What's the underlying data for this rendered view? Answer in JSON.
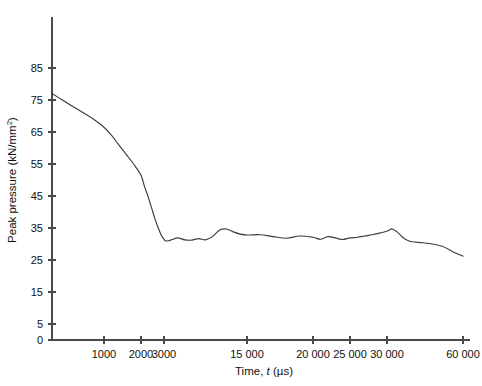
{
  "chart_data": {
    "type": "line",
    "title": "",
    "xlabel": "Time, t (µs)",
    "xlabel_parts": {
      "prefix": "Time, ",
      "italic": "t",
      "suffix": " (µs)"
    },
    "ylabel": "Peak pressure (kN/mm²)",
    "ylabel_parts": {
      "text": "Peak pressure (kN/mm",
      "superscript": "2",
      "close": ")"
    },
    "ylim": [
      0,
      90
    ],
    "y_ticks": [
      0,
      5,
      15,
      25,
      35,
      45,
      55,
      65,
      75,
      85
    ],
    "y_tick_labels": [
      "0",
      "5",
      "15",
      "25",
      "35",
      "45",
      "55",
      "65",
      "75",
      "85"
    ],
    "x_ticks": [
      1000,
      2000,
      3000,
      15000,
      20000,
      25000,
      30000,
      60000
    ],
    "x_tick_labels": [
      "1000",
      "2000",
      "3000",
      "15 000",
      "20 000",
      "25 000",
      "30 000",
      "60 000"
    ],
    "x_axis_note": "non-linear broken axis: fine scale below 3000 µs, compressed above",
    "grid": false,
    "legend": false,
    "series": [
      {
        "name": "Peak pressure",
        "color": "#3c3c3c",
        "x": [
          0,
          200,
          400,
          600,
          800,
          1000,
          1200,
          1400,
          1600,
          1800,
          2000,
          2150,
          2300,
          2450,
          2600,
          2750,
          2900,
          3000,
          3200,
          3600,
          4200,
          5000,
          6000,
          7000,
          8000,
          9000,
          10000,
          11000,
          12000,
          13000,
          14000,
          15000,
          16000,
          17000,
          18000,
          19000,
          20000,
          21000,
          22000,
          23000,
          24000,
          25000,
          26000,
          27000,
          28000,
          29000,
          30000,
          31000,
          32000,
          34000,
          36000,
          38000,
          40000,
          44000,
          48000,
          52000,
          56000,
          60000
        ],
        "y": [
          77.0,
          75.0,
          73.0,
          71.0,
          69.0,
          66.5,
          64.0,
          61.0,
          58.0,
          55.0,
          51.5,
          48.0,
          45.0,
          41.5,
          38.0,
          35.0,
          32.5,
          31.5,
          31.0,
          31.0,
          31.4,
          31.9,
          31.3,
          31.2,
          31.7,
          31.3,
          32.3,
          34.3,
          34.7,
          33.8,
          33.1,
          32.8,
          32.9,
          32.3,
          31.8,
          32.5,
          32.1,
          31.5,
          32.3,
          31.9,
          31.4,
          31.9,
          32.1,
          32.5,
          32.9,
          33.4,
          34.0,
          34.4,
          34.7,
          33.8,
          32.2,
          31.2,
          30.7,
          30.4,
          30.0,
          29.2,
          27.6,
          26.2
        ]
      }
    ]
  },
  "axes_geometry": {
    "plot_left_px": 52,
    "plot_right_px": 470,
    "plot_top_px": 17,
    "plot_bottom_px": 340,
    "x_tick_px": [
      104,
      141,
      164,
      247,
      313,
      350,
      387,
      463
    ],
    "y_value_to_px_zero": 340,
    "y_px_per_unit": 3.2
  }
}
